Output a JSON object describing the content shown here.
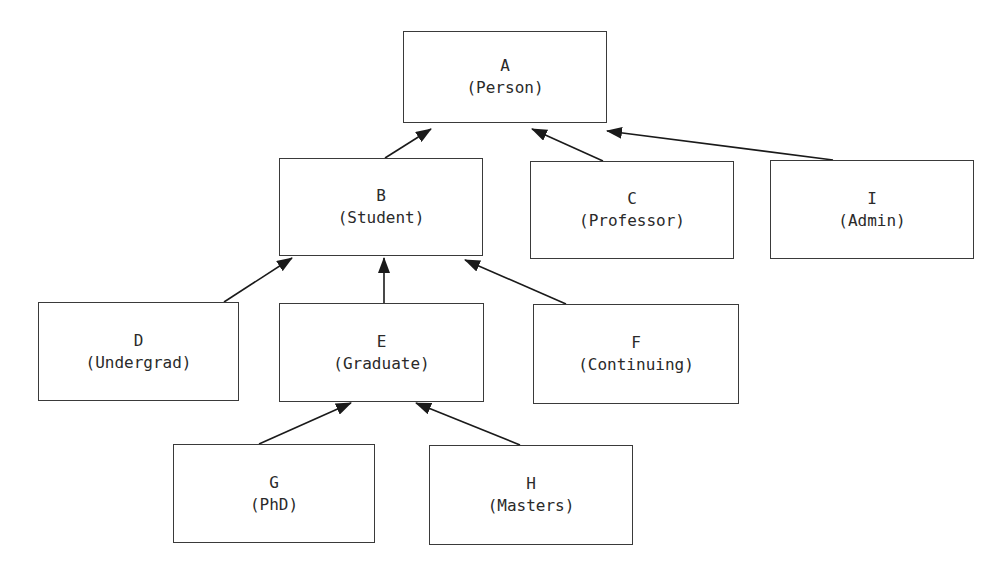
{
  "diagram": {
    "type": "class-hierarchy",
    "colors": {
      "background": "#ffffff",
      "box_border": "#3a3a3a",
      "text": "#2a2a2a",
      "edge": "#1a1a1a"
    },
    "nodes": {
      "A": {
        "letter": "A",
        "label": "(Person)"
      },
      "B": {
        "letter": "B",
        "label": "(Student)"
      },
      "C": {
        "letter": "C",
        "label": "(Professor)"
      },
      "I": {
        "letter": "I",
        "label": "(Admin)"
      },
      "D": {
        "letter": "D",
        "label": "(Undergrad)"
      },
      "E": {
        "letter": "E",
        "label": "(Graduate)"
      },
      "F": {
        "letter": "F",
        "label": "(Continuing)"
      },
      "G": {
        "letter": "G",
        "label": "(PhD)"
      },
      "H": {
        "letter": "H",
        "label": "(Masters)"
      }
    },
    "edges": [
      {
        "from": "B",
        "to": "A",
        "arrow": "filled-triangle"
      },
      {
        "from": "C",
        "to": "A",
        "arrow": "filled-triangle"
      },
      {
        "from": "I",
        "to": "A",
        "arrow": "filled-triangle"
      },
      {
        "from": "D",
        "to": "B",
        "arrow": "filled-triangle"
      },
      {
        "from": "E",
        "to": "B",
        "arrow": "filled-triangle"
      },
      {
        "from": "F",
        "to": "B",
        "arrow": "filled-triangle"
      },
      {
        "from": "G",
        "to": "E",
        "arrow": "filled-triangle"
      },
      {
        "from": "H",
        "to": "E",
        "arrow": "filled-triangle"
      }
    ]
  }
}
